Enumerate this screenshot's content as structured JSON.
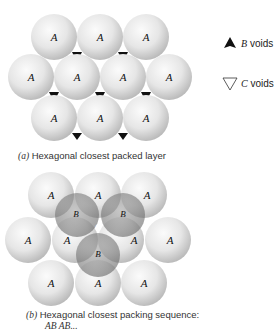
{
  "figure_a": {
    "caption_tag": "(a)",
    "caption_text": "Hexagonal closest packed layer",
    "sphere_label": "A",
    "spheres": [
      {
        "x": 54,
        "y": 37
      },
      {
        "x": 100,
        "y": 37
      },
      {
        "x": 146,
        "y": 37
      },
      {
        "x": 31,
        "y": 77
      },
      {
        "x": 77,
        "y": 77
      },
      {
        "x": 123,
        "y": 77
      },
      {
        "x": 169,
        "y": 77
      },
      {
        "x": 54,
        "y": 118
      },
      {
        "x": 100,
        "y": 118
      },
      {
        "x": 146,
        "y": 118
      }
    ]
  },
  "legend": {
    "b_voids_letter": "B",
    "b_voids_text": "voids",
    "c_voids_letter": "C",
    "c_voids_text": "voids"
  },
  "figure_b": {
    "caption_tag": "(b)",
    "caption_text": "Hexagonal closest packing sequence:",
    "caption_line2": "AB AB...",
    "a_label": "A",
    "b_label": "B",
    "c_label": "C"
  },
  "colors": {
    "sphere_light": "#f2f2f2",
    "sphere_dark": "#b8b8b8",
    "void": "#111111",
    "b_sphere": "#8a8a8a"
  }
}
